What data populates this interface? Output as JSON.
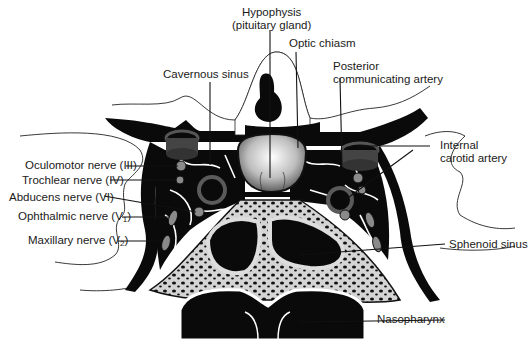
{
  "diagram": {
    "labels": {
      "hypophysis_line1": "Hypophysis",
      "hypophysis_line2": "(pituitary gland)",
      "optic_chiasm": "Optic chiasm",
      "cavernous_sinus": "Cavernous sinus",
      "posterior_comm_line1": "Posterior",
      "posterior_comm_line2": "communicating artery",
      "internal_carotid_line1": "Internal",
      "internal_carotid_line2": "carotid artery",
      "oculomotor": "Oculomotor nerve (III)",
      "trochlear": "Trochlear nerve (IV)",
      "abducens": "Abducens nerve (VI)",
      "ophthalmic_prefix": "Ophthalmic nerve (V",
      "ophthalmic_sub": "1",
      "ophthalmic_suffix": ")",
      "maxillary_prefix": "Maxillary nerve (V",
      "maxillary_sub": "2",
      "maxillary_suffix": ")",
      "sphenoid_sinus": "Sphenoid sinus",
      "nasopharynx": "Nasopharynx"
    },
    "colors": {
      "ink": "#0a0a0a",
      "nerve_gray": "#8a8a8a",
      "bone_gray": "#d4d4d4",
      "artery_wall": "#5a5a5a",
      "background": "#ffffff"
    }
  }
}
